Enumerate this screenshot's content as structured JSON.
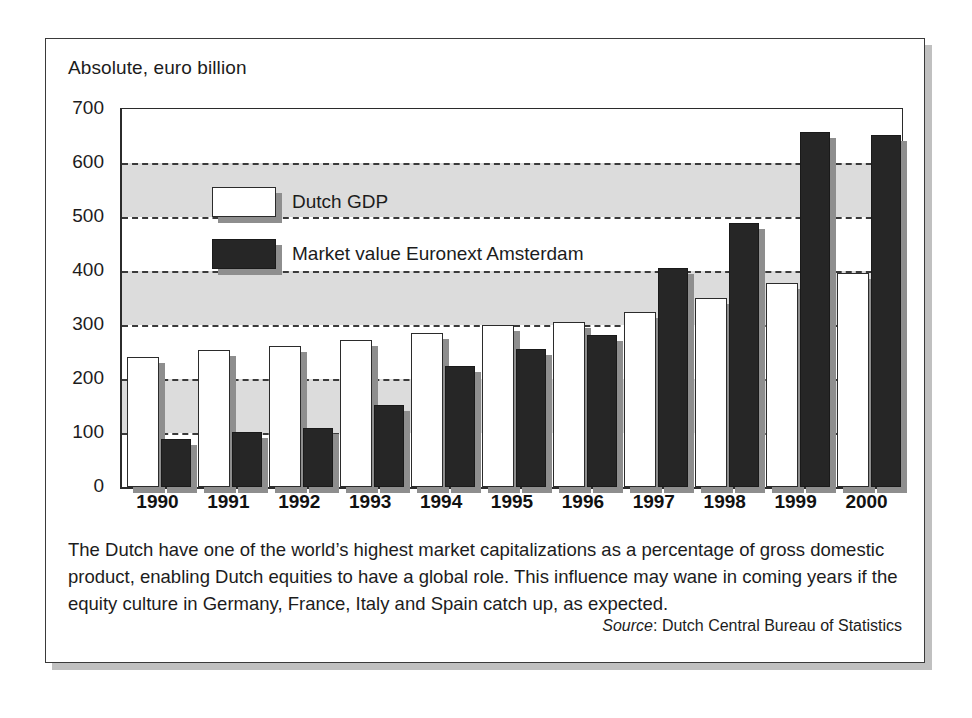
{
  "figure": {
    "axis_title": "Absolute, euro billion",
    "caption": "The Dutch have one of the world’s highest market capitalizations as a percentage of gross domestic product, enabling Dutch equities to have a global role. This influence may wane in coming years if the equity culture in Germany, France, Italy and Spain catch up, as expected.",
    "source_label": "Source",
    "source_text": ": Dutch Central Bureau of Statistics"
  },
  "chart_data": {
    "type": "bar",
    "title": "Absolute, euro billion",
    "xlabel": "",
    "ylabel": "Absolute, euro billion",
    "ylim": [
      0,
      700
    ],
    "ytick_values": [
      0,
      100,
      200,
      300,
      400,
      500,
      600,
      700
    ],
    "ytick_labels": [
      "0",
      "100",
      "200",
      "300",
      "400",
      "500",
      "600",
      "700"
    ],
    "grid": "horizontal-dashed",
    "shaded_bands": [
      [
        100,
        200
      ],
      [
        300,
        400
      ],
      [
        500,
        600
      ]
    ],
    "legend_position": "inside-top-left",
    "categories": [
      "1990",
      "1991",
      "1992",
      "1993",
      "1994",
      "1995",
      "1996",
      "1997",
      "1998",
      "1999",
      "2000"
    ],
    "series": [
      {
        "name": "Dutch GDP",
        "color": "#ffffff",
        "values": [
          240,
          253,
          262,
          272,
          286,
          300,
          305,
          325,
          350,
          377,
          396
        ]
      },
      {
        "name": "Market value Euronext Amsterdam",
        "color": "#262626",
        "values": [
          88,
          102,
          110,
          152,
          224,
          256,
          281,
          405,
          488,
          657,
          651
        ]
      }
    ]
  },
  "colors": {
    "band": "#dcdcdc",
    "axis": "#2b2b2b",
    "bar_shadow": "#8e8e8e",
    "panel_border": "#3a3a3a"
  }
}
